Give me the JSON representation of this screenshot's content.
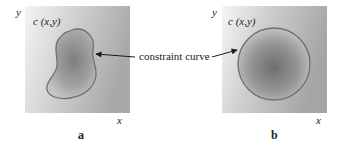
{
  "figure": {
    "callout_label": "constraint curve",
    "panels": [
      {
        "letter": "a",
        "y_axis": "y",
        "x_axis": "x",
        "function_label": "c (x,y)",
        "shape": "irregular-blob"
      },
      {
        "letter": "b",
        "y_axis": "y",
        "x_axis": "x",
        "function_label": "c (x,y)",
        "shape": "circle"
      }
    ],
    "colors": {
      "curve_stroke": "#6f6f6f",
      "arrow": "#1a1a1a",
      "field_light": "#f2f2f2",
      "field_mid": "#b8b8b8",
      "region_dark": "#7a7a7a"
    }
  }
}
